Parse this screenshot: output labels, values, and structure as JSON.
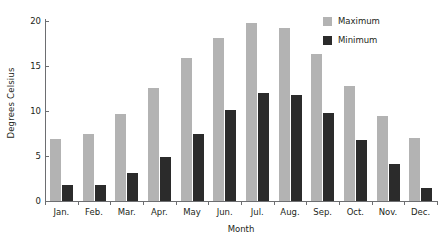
{
  "chart_data": {
    "type": "bar",
    "title": "",
    "xlabel": "Month",
    "ylabel": "Degrees Celsius",
    "categories": [
      "Jan.",
      "Feb.",
      "Mar.",
      "Apr.",
      "May",
      "Jun.",
      "Jul.",
      "Aug.",
      "Sep.",
      "Oct.",
      "Nov.",
      "Dec."
    ],
    "series": [
      {
        "name": "Maximum",
        "color": "#b3b3b3",
        "values": [
          6.9,
          7.4,
          9.7,
          12.6,
          15.9,
          18.1,
          19.8,
          19.2,
          16.3,
          12.8,
          9.4,
          7.0
        ]
      },
      {
        "name": "Minimum",
        "color": "#2b2b2b",
        "values": [
          1.8,
          1.8,
          3.1,
          4.9,
          7.4,
          10.1,
          12.0,
          11.8,
          9.8,
          6.8,
          4.1,
          1.5
        ]
      }
    ],
    "ylim": [
      0,
      20
    ],
    "yticks": [
      0,
      5,
      10,
      15,
      20
    ],
    "ytick_labels": [
      "0",
      "5",
      "10",
      "15",
      "20"
    ],
    "grid": false,
    "legend_position": "top-right"
  },
  "axes": {
    "y_title": "Degrees Celsius",
    "x_title": "Month"
  },
  "legend": {
    "items": [
      {
        "label": "Maximum",
        "color": "#b3b3b3"
      },
      {
        "label": "Minimum",
        "color": "#2b2b2b"
      }
    ]
  }
}
